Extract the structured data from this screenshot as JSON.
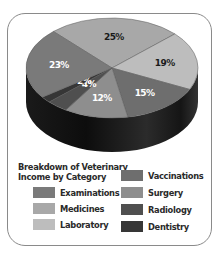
{
  "chart_data": {
    "type": "pie",
    "title": "Breakdown of Veterinary Income by Category",
    "style": "3d",
    "categories": [
      "Medicines",
      "Laboratory",
      "Vaccinations",
      "Surgery",
      "Radiology",
      "Dentistry",
      "Examinations"
    ],
    "values": [
      25,
      19,
      15,
      12,
      4,
      2,
      23
    ],
    "labels": [
      "25%",
      "19%",
      "15%",
      "12%",
      "4%",
      "2%",
      "23%"
    ],
    "colors": [
      "#a8a8a8",
      "#bdbdbd",
      "#6e6e6e",
      "#8e8e8e",
      "#4f4f4f",
      "#363636",
      "#7a7a7a"
    ],
    "legend_position": "bottom"
  },
  "legend": {
    "title_line1": "Breakdown of Veterinary",
    "title_line2": "Income by Category",
    "items": [
      {
        "label": "Examinations",
        "color": "#7a7a7a"
      },
      {
        "label": "Medicines",
        "color": "#a8a8a8"
      },
      {
        "label": "Laboratory",
        "color": "#bdbdbd"
      },
      {
        "label": "Vaccinations",
        "color": "#6e6e6e"
      },
      {
        "label": "Surgery",
        "color": "#8e8e8e"
      },
      {
        "label": "Radiology",
        "color": "#4f4f4f"
      },
      {
        "label": "Dentistry",
        "color": "#363636"
      }
    ]
  }
}
